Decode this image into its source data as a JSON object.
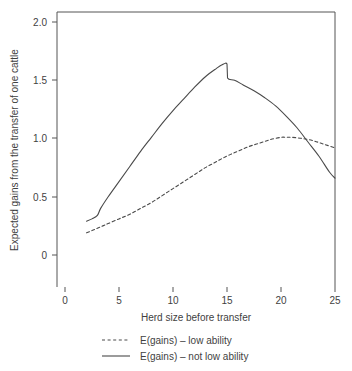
{
  "chart_data": {
    "type": "line",
    "title": "",
    "xlabel": "Herd size before transfer",
    "ylabel": "Expected gains from the transfer of one cattle",
    "xlim": [
      0,
      26
    ],
    "ylim": [
      0,
      2.0
    ],
    "xticks": [
      "0",
      "5",
      "10",
      "15",
      "20",
      "25"
    ],
    "xtick_values": [
      0,
      5,
      10,
      15,
      20,
      25
    ],
    "yticks": [
      "0",
      "0.5",
      "1.0",
      "1.5",
      "2.0"
    ],
    "ytick_values": [
      0,
      0.5,
      1.0,
      1.5,
      2.0
    ],
    "grid": false,
    "legend_position": "below",
    "series": [
      {
        "name": "E(gains) – low ability",
        "style": "dashed",
        "color": "#4a4a4a",
        "x": [
          2.0,
          2.5,
          3.0,
          3.5,
          4.0,
          5.0,
          6.0,
          7.0,
          8.0,
          9.0,
          10.0,
          11.0,
          12.0,
          13.0,
          14.0,
          15.0,
          16.0,
          17.0,
          18.0,
          19.0,
          20.0,
          20.5,
          21.0,
          22.0,
          23.0,
          24.0,
          25.0
        ],
        "y": [
          0.19,
          0.21,
          0.23,
          0.25,
          0.27,
          0.31,
          0.35,
          0.4,
          0.45,
          0.51,
          0.57,
          0.63,
          0.69,
          0.75,
          0.8,
          0.85,
          0.89,
          0.93,
          0.96,
          0.99,
          1.01,
          1.01,
          1.01,
          1.0,
          0.98,
          0.95,
          0.92
        ]
      },
      {
        "name": "E(gains) – not low ability",
        "style": "solid",
        "color": "#4a4a4a",
        "x": [
          2.0,
          2.5,
          3.0,
          3.3,
          4.0,
          5.0,
          6.0,
          7.0,
          8.0,
          9.0,
          10.0,
          11.0,
          12.0,
          13.0,
          14.0,
          14.5,
          15.0,
          15.05,
          15.7,
          16.5,
          17.5,
          18.5,
          19.5,
          20.5,
          21.5,
          22.5,
          23.5,
          24.5,
          25.0
        ],
        "y": [
          0.29,
          0.31,
          0.34,
          0.4,
          0.5,
          0.63,
          0.76,
          0.89,
          1.01,
          1.13,
          1.24,
          1.34,
          1.44,
          1.53,
          1.6,
          1.63,
          1.64,
          1.52,
          1.5,
          1.46,
          1.41,
          1.35,
          1.28,
          1.19,
          1.09,
          0.97,
          0.85,
          0.71,
          0.66
        ]
      }
    ],
    "annotations": [
      "Solid curve shows a kink and sharp drop just after herd size 15",
      "Curves intersect near herd size 22"
    ]
  },
  "legend": {
    "items": [
      {
        "label": "E(gains) – low ability",
        "style": "dashed"
      },
      {
        "label": "E(gains) – not low ability",
        "style": "solid"
      }
    ]
  },
  "colors": {
    "line": "#4a4a4a",
    "axis": "#555555",
    "text": "#3f3f3f",
    "background": "#ffffff"
  }
}
